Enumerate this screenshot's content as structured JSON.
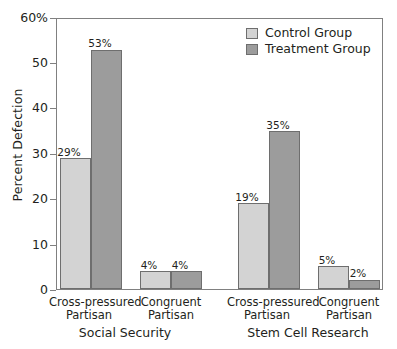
{
  "chart_data": {
    "type": "bar",
    "title": "",
    "xlabel": "",
    "ylabel": "Percent Defection",
    "ylim": [
      0,
      60
    ],
    "grid": false,
    "legend_position": "top-right",
    "y_ticks": [
      {
        "value": 60,
        "label": "60%"
      },
      {
        "value": 50,
        "label": "50"
      },
      {
        "value": 40,
        "label": "40"
      },
      {
        "value": 30,
        "label": "30"
      },
      {
        "value": 20,
        "label": "20"
      },
      {
        "value": 10,
        "label": "10"
      },
      {
        "value": 0,
        "label": "0"
      }
    ],
    "legend": [
      {
        "name": "Control Group",
        "color": "#d3d3d3"
      },
      {
        "name": "Treatment Group",
        "color": "#9c9c9c"
      }
    ],
    "panels": [
      {
        "label": "Social Security",
        "categories": [
          "Cross-pressured Partisan",
          "Congruent Partisan"
        ],
        "category_lines": [
          [
            "Cross-pressured",
            "Partisan"
          ],
          [
            "Congruent",
            "Partisan"
          ]
        ],
        "series": [
          {
            "name": "Control Group",
            "values": [
              29,
              4
            ],
            "labels": [
              "29%",
              "4%"
            ]
          },
          {
            "name": "Treatment Group",
            "values": [
              53,
              4
            ],
            "labels": [
              "53%",
              "4%"
            ]
          }
        ]
      },
      {
        "label": "Stem Cell Research",
        "categories": [
          "Cross-pressured Partisan",
          "Congruent Partisan"
        ],
        "category_lines": [
          [
            "Cross-pressured",
            "Partisan"
          ],
          [
            "Congruent",
            "Partisan"
          ]
        ],
        "series": [
          {
            "name": "Control Group",
            "values": [
              19,
              5
            ],
            "labels": [
              "19%",
              "5%"
            ]
          },
          {
            "name": "Treatment Group",
            "values": [
              35,
              2
            ],
            "labels": [
              "35%",
              "2%"
            ]
          }
        ]
      }
    ]
  },
  "y_axis": {
    "title": "Percent Defection",
    "t0": "60%",
    "t1": "50",
    "t2": "40",
    "t3": "30",
    "t4": "20",
    "t5": "10",
    "t6": "0"
  },
  "legend": {
    "control": "Control Group",
    "treatment": "Treatment Group"
  },
  "panel_a": {
    "group_label": "Social Security",
    "cat1_line1": "Cross-pressured",
    "cat1_line2": "Partisan",
    "cat2_line1": "Congruent",
    "cat2_line2": "Partisan",
    "v_control_1": "29%",
    "v_treatment_1": "53%",
    "v_control_2": "4%",
    "v_treatment_2": "4%"
  },
  "panel_b": {
    "group_label": "Stem Cell Research",
    "cat1_line1": "Cross-pressured",
    "cat1_line2": "Partisan",
    "cat2_line1": "Congruent",
    "cat2_line2": "Partisan",
    "v_control_1": "19%",
    "v_treatment_1": "35%",
    "v_control_2": "5%",
    "v_treatment_2": "2%"
  },
  "colors": {
    "control": "#d3d3d3",
    "treatment": "#9c9c9c",
    "axis": "#808080",
    "text": "#231f20"
  }
}
